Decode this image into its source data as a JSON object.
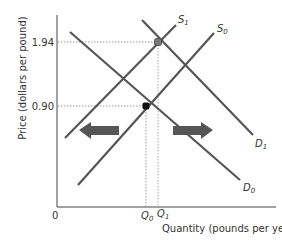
{
  "chart_data": {
    "type": "line",
    "title": "",
    "xlabel": "Quantity (pounds per year)",
    "ylabel": "Price (dollars per pound)",
    "origin_label": "0",
    "y_ticks": [
      {
        "label": "1.94",
        "value": 1.94
      },
      {
        "label": "0.90",
        "value": 0.9
      }
    ],
    "x_ticks": [
      {
        "label": "Q0",
        "main": "Q",
        "sub": "0"
      },
      {
        "label": "Q1",
        "main": "Q",
        "sub": "1"
      }
    ],
    "series": [
      {
        "name": "S1",
        "main": "S",
        "sub": "1",
        "kind": "supply",
        "points": [
          [
            65,
            138
          ],
          [
            176,
            25
          ]
        ]
      },
      {
        "name": "S0",
        "main": "S",
        "sub": "0",
        "kind": "supply",
        "points": [
          [
            78,
            185
          ],
          [
            214,
            33
          ]
        ]
      },
      {
        "name": "D1",
        "main": "D",
        "sub": "1",
        "kind": "demand",
        "points": [
          [
            142,
            20
          ],
          [
            253,
            135
          ]
        ]
      },
      {
        "name": "D0",
        "main": "D",
        "sub": "0",
        "kind": "demand",
        "points": [
          [
            70,
            32
          ],
          [
            240,
            180
          ]
        ]
      }
    ],
    "equilibria": [
      {
        "name": "initial",
        "price": 0.9,
        "quantity": "Q0",
        "color": "#111111"
      },
      {
        "name": "new",
        "price": 1.94,
        "quantity": "Q1",
        "color": "#777777"
      }
    ],
    "annotations": [
      {
        "type": "arrow",
        "direction": "left",
        "meaning": "supply shift"
      },
      {
        "type": "arrow",
        "direction": "right",
        "meaning": "demand shift"
      }
    ],
    "grid": false
  },
  "colors": {
    "curve": "#555555",
    "axis": "#444444",
    "arrow": "#555555",
    "guide": "#999999"
  }
}
